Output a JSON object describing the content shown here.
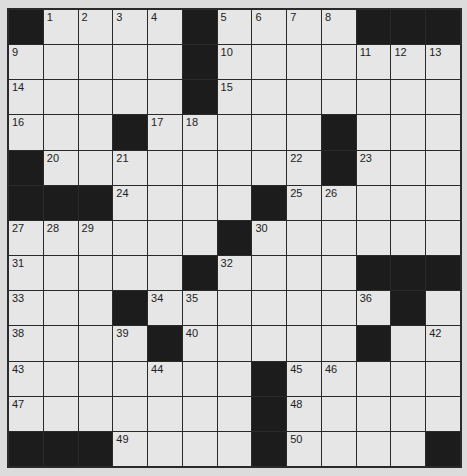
{
  "puzzle": {
    "rows": 13,
    "cols": 13,
    "colors": {
      "cell": "#e6e6e6",
      "block": "#1c1c1c",
      "border": "#2a2a2a",
      "background": "#dcdcdc"
    },
    "grid": [
      "#....#....###",
      ".....#.......",
      ".....#.......",
      "...#.....#...",
      "#........#...",
      "###....#.....",
      "......#......",
      ".....#....###",
      "...#.......#.",
      "....#.....#..",
      ".......#.....",
      ".......#.....",
      "###....#....#"
    ],
    "numbers": [
      [
        "",
        "1",
        "2",
        "3",
        "4",
        "",
        "5",
        "6",
        "7",
        "8",
        "",
        "",
        ""
      ],
      [
        "9",
        "",
        "",
        "",
        "",
        "",
        "10",
        "",
        "",
        "",
        "11",
        "12",
        "13"
      ],
      [
        "14",
        "",
        "",
        "",
        "",
        "",
        "15",
        "",
        "",
        "",
        "",
        "",
        ""
      ],
      [
        "16",
        "",
        "",
        "",
        "17",
        "18",
        "",
        "",
        "",
        "19",
        "",
        "",
        ""
      ],
      [
        "",
        "20",
        "",
        "21",
        "",
        "",
        "",
        "",
        "22",
        "",
        "23",
        "",
        ""
      ],
      [
        "",
        "",
        "",
        "24",
        "",
        "",
        "",
        "",
        "25",
        "26",
        "",
        "",
        ""
      ],
      [
        "27",
        "28",
        "29",
        "",
        "",
        "",
        "",
        "30",
        "",
        "",
        "",
        "",
        ""
      ],
      [
        "31",
        "",
        "",
        "",
        "",
        "",
        "32",
        "",
        "",
        "",
        "",
        "",
        ""
      ],
      [
        "33",
        "",
        "",
        "",
        "34",
        "35",
        "",
        "",
        "",
        "",
        "36",
        "37",
        ""
      ],
      [
        "38",
        "",
        "",
        "39",
        "",
        "40",
        "",
        "",
        "",
        "",
        "41",
        "",
        "42"
      ],
      [
        "43",
        "",
        "",
        "",
        "44",
        "",
        "",
        "",
        "45",
        "46",
        "",
        "",
        ""
      ],
      [
        "47",
        "",
        "",
        "",
        "",
        "",
        "",
        "",
        "48",
        "",
        "",
        "",
        ""
      ],
      [
        "",
        "",
        "",
        "49",
        "",
        "",
        "",
        "",
        "50",
        "",
        "",
        "",
        ""
      ]
    ]
  }
}
